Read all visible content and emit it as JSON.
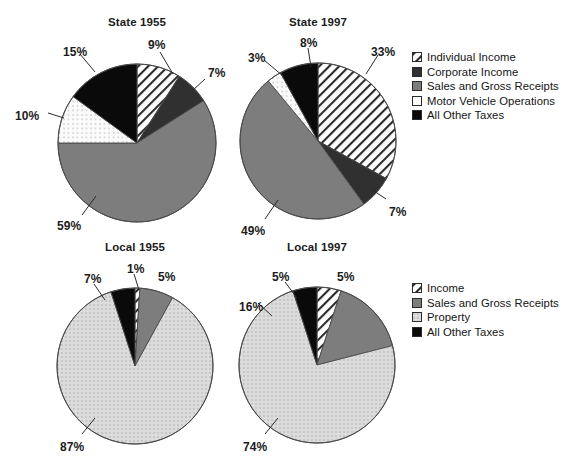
{
  "figure": {
    "background": "#ffffff",
    "faint_header_fragments": [
      "",
      ""
    ]
  },
  "palette": {
    "hatch_line": "#2b2b2b",
    "hatch_bg": "#ffffff",
    "corporate_gray": "#303030",
    "sales_gray": "#7d7d7d",
    "motor_white": "#ffffff",
    "property_light": "#d6d6d6",
    "property_dot": "#a9a9a9",
    "other_black": "#0a0a0a",
    "outline": "#4a4a4a",
    "text": "#1c1c1c"
  },
  "charts": [
    {
      "id": "state-1955",
      "title": "State 1955",
      "cx": 137,
      "cy": 143,
      "r": 79,
      "title_x": 137,
      "title_y": 16,
      "slices": [
        {
          "key": "individual_income",
          "label": "Individual Income",
          "value": 9,
          "pattern": "hatch"
        },
        {
          "key": "corporate_income",
          "label": "Corporate Income",
          "value": 7,
          "pattern": "dark-gray"
        },
        {
          "key": "sales_gross",
          "label": "Sales and Gross Receipts",
          "value": 59,
          "pattern": "mid-gray"
        },
        {
          "key": "motor_vehicle",
          "label": "Motor Vehicle Operations",
          "value": 10,
          "pattern": "dotted-white"
        },
        {
          "key": "all_other",
          "label": "All Other Taxes",
          "value": 15,
          "pattern": "black"
        }
      ],
      "labels": [
        {
          "text": "9%",
          "x": 148,
          "y": 38,
          "lx1": 160,
          "ly1": 52,
          "lx2": 173,
          "ly2": 74
        },
        {
          "text": "7%",
          "x": 208,
          "y": 66,
          "lx1": 205,
          "ly1": 79,
          "lx2": 192,
          "ly2": 91
        },
        {
          "text": "59%",
          "x": 57,
          "y": 219,
          "lx1": 82,
          "ly1": 215,
          "lx2": 96,
          "ly2": 196
        },
        {
          "text": "10%",
          "x": 15,
          "y": 109,
          "lx1": 48,
          "ly1": 113,
          "lx2": 64,
          "ly2": 118
        },
        {
          "text": "15%",
          "x": 63,
          "y": 45,
          "lx1": 80,
          "ly1": 54,
          "lx2": 95,
          "ly2": 72
        }
      ]
    },
    {
      "id": "state-1997",
      "title": "State 1997",
      "cx": 318,
      "cy": 141,
      "r": 78,
      "title_x": 318,
      "title_y": 16,
      "slices": [
        {
          "key": "individual_income",
          "label": "Individual Income",
          "value": 33,
          "pattern": "hatch"
        },
        {
          "key": "corporate_income",
          "label": "Corporate Income",
          "value": 7,
          "pattern": "dark-gray"
        },
        {
          "key": "sales_gross",
          "label": "Sales and Gross Receipts",
          "value": 49,
          "pattern": "mid-gray"
        },
        {
          "key": "motor_vehicle",
          "label": "Motor Vehicle Operations",
          "value": 3,
          "pattern": "dotted-white"
        },
        {
          "key": "all_other",
          "label": "All Other Taxes",
          "value": 8,
          "pattern": "black"
        }
      ],
      "labels": [
        {
          "text": "33%",
          "x": 371,
          "y": 45,
          "lx1": 378,
          "ly1": 55,
          "lx2": 366,
          "ly2": 74
        },
        {
          "text": "7%",
          "x": 389,
          "y": 205,
          "lx1": 386,
          "ly1": 199,
          "lx2": 371,
          "ly2": 189
        },
        {
          "text": "49%",
          "x": 241,
          "y": 224,
          "lx1": 265,
          "ly1": 219,
          "lx2": 278,
          "ly2": 200
        },
        {
          "text": "3%",
          "x": 248,
          "y": 51,
          "lx1": 264,
          "ly1": 60,
          "lx2": 283,
          "ly2": 76
        },
        {
          "text": "8%",
          "x": 300,
          "y": 36,
          "lx1": 308,
          "ly1": 48,
          "lx2": 311,
          "ly2": 67
        }
      ]
    },
    {
      "id": "local-1955",
      "title": "Local 1955",
      "cx": 135,
      "cy": 366,
      "r": 78,
      "title_x": 135,
      "title_y": 241,
      "slices": [
        {
          "key": "income",
          "label": "Income",
          "value": 1,
          "pattern": "hatch"
        },
        {
          "key": "sales_gross",
          "label": "Sales and Gross Receipts",
          "value": 7,
          "pattern": "mid-gray"
        },
        {
          "key": "property",
          "label": "Property",
          "value": 87,
          "pattern": "dotted-light"
        },
        {
          "key": "all_other",
          "label": "All Other Taxes",
          "value": 5,
          "pattern": "black"
        }
      ],
      "labels": [
        {
          "text": "5%",
          "x": 158,
          "y": 270,
          "lx1": 0,
          "ly1": 0,
          "lx2": 0,
          "ly2": 0
        },
        {
          "text": "1%",
          "x": 127,
          "y": 262,
          "lx1": 134,
          "ly1": 274,
          "lx2": 139,
          "ly2": 290
        },
        {
          "text": "7%",
          "x": 84,
          "y": 272,
          "lx1": 94,
          "ly1": 284,
          "lx2": 105,
          "ly2": 300
        },
        {
          "text": "87%",
          "x": 60,
          "y": 440,
          "lx1": 82,
          "ly1": 434,
          "lx2": 95,
          "ly2": 418
        }
      ]
    },
    {
      "id": "local-1997",
      "title": "Local 1997",
      "cx": 317,
      "cy": 365,
      "r": 78,
      "title_x": 317,
      "title_y": 241,
      "slices": [
        {
          "key": "income",
          "label": "Income",
          "value": 5,
          "pattern": "hatch"
        },
        {
          "key": "sales_gross",
          "label": "Sales and Gross Receipts",
          "value": 16,
          "pattern": "mid-gray"
        },
        {
          "key": "property",
          "label": "Property",
          "value": 74,
          "pattern": "dotted-light"
        },
        {
          "key": "all_other",
          "label": "All Other Taxes",
          "value": 5,
          "pattern": "black"
        }
      ],
      "labels": [
        {
          "text": "5%",
          "x": 337,
          "y": 270,
          "lx1": 0,
          "ly1": 0,
          "lx2": 0,
          "ly2": 0
        },
        {
          "text": "5%",
          "x": 272,
          "y": 270,
          "lx1": 285,
          "ly1": 282,
          "lx2": 297,
          "ly2": 298
        },
        {
          "text": "16%",
          "x": 239,
          "y": 300,
          "lx1": 258,
          "ly1": 303,
          "lx2": 272,
          "ly2": 316
        },
        {
          "text": "74%",
          "x": 243,
          "y": 440,
          "lx1": 265,
          "ly1": 434,
          "lx2": 278,
          "ly2": 418
        }
      ]
    }
  ],
  "legends": [
    {
      "id": "legend-state",
      "x": 412,
      "y": 50,
      "items": [
        {
          "label": "Individual Income",
          "pattern": "hatch"
        },
        {
          "label": "Corporate Income",
          "pattern": "dark-gray"
        },
        {
          "label": "Sales and Gross Receipts",
          "pattern": "mid-gray"
        },
        {
          "label": "Motor Vehicle Operations",
          "pattern": "motor-white"
        },
        {
          "label": "All Other Taxes",
          "pattern": "black"
        }
      ]
    },
    {
      "id": "legend-local",
      "x": 412,
      "y": 281,
      "items": [
        {
          "label": "Income",
          "pattern": "hatch"
        },
        {
          "label": "Sales and Gross Receipts",
          "pattern": "mid-gray"
        },
        {
          "label": "Property",
          "pattern": "dotted-light"
        },
        {
          "label": "All Other Taxes",
          "pattern": "black"
        }
      ]
    }
  ],
  "chart_data": {
    "type": "pie",
    "unit": "percent of total tax revenue",
    "charts": [
      {
        "title": "State 1955",
        "categories": [
          "Individual Income",
          "Corporate Income",
          "Sales and Gross Receipts",
          "Motor Vehicle Operations",
          "All Other Taxes"
        ],
        "values": [
          9,
          7,
          59,
          10,
          15
        ],
        "labels": [
          "9%",
          "7%",
          "59%",
          "10%",
          "15%"
        ]
      },
      {
        "title": "State 1997",
        "categories": [
          "Individual Income",
          "Corporate Income",
          "Sales and Gross Receipts",
          "Motor Vehicle Operations",
          "All Other Taxes"
        ],
        "values": [
          33,
          7,
          49,
          3,
          8
        ],
        "labels": [
          "33%",
          "7%",
          "49%",
          "3%",
          "8%"
        ]
      },
      {
        "title": "Local 1955",
        "categories": [
          "Income",
          "Sales and Gross Receipts",
          "Property",
          "All Other Taxes"
        ],
        "values": [
          1,
          7,
          87,
          5
        ],
        "labels": [
          "1%",
          "7%",
          "87%",
          "5%"
        ]
      },
      {
        "title": "Local 1997",
        "categories": [
          "Income",
          "Sales and Gross Receipts",
          "Property",
          "All Other Taxes"
        ],
        "values": [
          5,
          16,
          74,
          5
        ],
        "labels": [
          "5%",
          "16%",
          "74%",
          "5%"
        ]
      }
    ],
    "legend_position": "right",
    "grid": false
  }
}
